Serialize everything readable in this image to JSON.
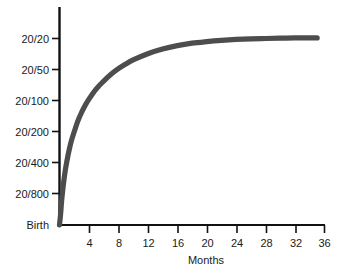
{
  "chart_data": {
    "type": "line",
    "title": "",
    "subtitle": "",
    "xlabel": "Months",
    "ylabel": "",
    "grid": false,
    "legend": "none",
    "line_color": "#4d4d4d",
    "axis_color": "#111111",
    "background_color": "#ffffff",
    "xlim": [
      0,
      36
    ],
    "xticks": [
      4,
      8,
      12,
      16,
      20,
      24,
      28,
      32,
      36
    ],
    "xtick_labels": [
      "4",
      "8",
      "12",
      "16",
      "20",
      "24",
      "28",
      "32",
      "36"
    ],
    "ylim_labels": [
      "Birth",
      "20/800",
      "20/400",
      "20/200",
      "20/100",
      "20/50",
      "20/20"
    ],
    "yticks": [
      0,
      1,
      2,
      3,
      4,
      5,
      6
    ],
    "ytick_labels": [
      "Birth",
      "20/800",
      "20/400",
      "20/200",
      "20/100",
      "20/50",
      "20/20"
    ],
    "ytick_labels_top_to_bottom": [
      "20/20",
      "20/50",
      "20/100",
      "20/200",
      "20/400",
      "20/800",
      "Birth"
    ],
    "series": [
      {
        "name": "Visual acuity",
        "x": [
          0,
          0.15,
          0.3,
          0.5,
          0.75,
          1.0,
          1.3,
          1.6,
          2.0,
          2.5,
          3.0,
          3.5,
          4.0,
          5.0,
          6.0,
          7.0,
          8.0,
          9.0,
          10.0,
          12.0,
          14.0,
          16.0,
          18.0,
          20.0,
          22.0,
          24.0,
          26.0,
          28.0,
          30.0,
          32.0,
          34.0,
          35.0
        ],
        "y": [
          0.0,
          0.35,
          0.8,
          1.25,
          1.7,
          2.05,
          2.4,
          2.7,
          3.0,
          3.35,
          3.62,
          3.85,
          4.05,
          4.38,
          4.63,
          4.85,
          5.03,
          5.18,
          5.31,
          5.51,
          5.66,
          5.77,
          5.85,
          5.9,
          5.94,
          5.97,
          5.99,
          6.0,
          6.01,
          6.02,
          6.02,
          6.02
        ]
      }
    ],
    "annotations": []
  },
  "axes": {
    "x_axis_title": "Months",
    "y_tick_0": "20/20",
    "y_tick_1": "20/50",
    "y_tick_2": "20/100",
    "y_tick_3": "20/200",
    "y_tick_4": "20/400",
    "y_tick_5": "20/800",
    "y_tick_6": "Birth",
    "x_tick_0": "4",
    "x_tick_1": "8",
    "x_tick_2": "12",
    "x_tick_3": "16",
    "x_tick_4": "20",
    "x_tick_5": "24",
    "x_tick_6": "28",
    "x_tick_7": "32",
    "x_tick_8": "36"
  }
}
